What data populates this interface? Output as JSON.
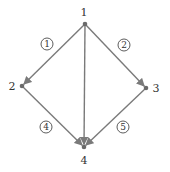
{
  "diagram": {
    "type": "directed-graph",
    "edge_color": "#7a7a7a",
    "node_color": "#6a6a6a",
    "text_color": "#333333",
    "nodes": [
      {
        "id": "1",
        "label": "1",
        "x": 85,
        "y": 24,
        "lx": 84,
        "ly": 16
      },
      {
        "id": "2",
        "label": "2",
        "x": 22,
        "y": 86,
        "lx": 12,
        "ly": 90
      },
      {
        "id": "3",
        "label": "3",
        "x": 146,
        "y": 88,
        "lx": 156,
        "ly": 92
      },
      {
        "id": "4",
        "label": "4",
        "x": 84,
        "y": 147,
        "lx": 84,
        "ly": 164
      }
    ],
    "edges": [
      {
        "from": "1",
        "to": "2",
        "label": "1",
        "cx": 47,
        "cy": 44
      },
      {
        "from": "1",
        "to": "3",
        "label": "2",
        "cx": 124,
        "cy": 45
      },
      {
        "from": "1",
        "to": "4",
        "label": "",
        "cx": null,
        "cy": null
      },
      {
        "from": "2",
        "to": "4",
        "label": "4",
        "cx": 46,
        "cy": 127
      },
      {
        "from": "3",
        "to": "4",
        "label": "5",
        "cx": 123,
        "cy": 127
      }
    ]
  }
}
